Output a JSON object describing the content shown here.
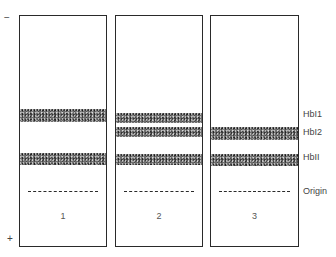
{
  "figure": {
    "polarity": {
      "top": "−",
      "bottom": "+"
    },
    "labels": {
      "hbi1": "HbI1",
      "hbi2": "HbI2",
      "hbii": "HbII",
      "origin": "Origin"
    },
    "lanes": [
      {
        "number": "1",
        "bands": [
          "HbI1",
          "HbII"
        ]
      },
      {
        "number": "2",
        "bands": [
          "HbI1",
          "HbI2",
          "HbII"
        ]
      },
      {
        "number": "3",
        "bands": [
          "HbI2",
          "HbII"
        ]
      }
    ]
  }
}
